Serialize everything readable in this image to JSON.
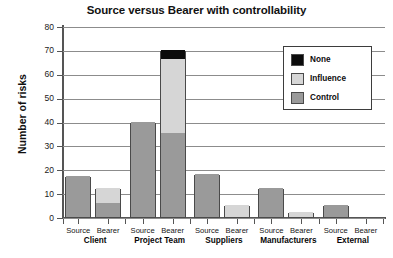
{
  "chart_data": {
    "type": "bar",
    "title": "Source versus Bearer with controllability",
    "xlabel": "",
    "ylabel": "Number of risks",
    "ylim": [
      0,
      80
    ],
    "ytick_step": 10,
    "yticks": [
      80,
      70,
      60,
      50,
      40,
      30,
      20,
      10,
      0
    ],
    "grid": true,
    "stacked": true,
    "legend_position": "inside-top-right",
    "categories": [
      "Client Source",
      "Client Bearer",
      "Project Team Source",
      "Project Team Bearer",
      "Suppliers Source",
      "Suppliers Bearer",
      "Manufacturers Source",
      "Manufacturers Bearer",
      "External Source",
      "External Bearer"
    ],
    "series": [
      {
        "name": "Control",
        "color": "#9a9a9a",
        "values": [
          17,
          6,
          40,
          35,
          18,
          0,
          12,
          0,
          5,
          0
        ]
      },
      {
        "name": "Influence",
        "color": "#d6d6d6",
        "values": [
          0,
          6,
          0,
          31,
          0,
          5,
          0,
          2,
          0,
          0
        ]
      },
      {
        "name": "None",
        "color": "#0b0b0b",
        "values": [
          0,
          0,
          0,
          4,
          0,
          0,
          0,
          0,
          0,
          0
        ]
      }
    ],
    "group_totals": [
      17,
      12,
      40,
      70,
      18,
      5,
      12,
      2,
      5,
      0
    ],
    "groups": [
      {
        "group": "Client",
        "bars": [
          {
            "role": "Source",
            "total": 17,
            "control": 17,
            "influence": 0,
            "none": 0
          },
          {
            "role": "Bearer",
            "total": 12,
            "control": 6,
            "influence": 6,
            "none": 0
          }
        ]
      },
      {
        "group": "Project Team",
        "bars": [
          {
            "role": "Source",
            "total": 40,
            "control": 40,
            "influence": 0,
            "none": 0
          },
          {
            "role": "Bearer",
            "total": 70,
            "control": 35,
            "influence": 31,
            "none": 4
          }
        ]
      },
      {
        "group": "Suppliers",
        "bars": [
          {
            "role": "Source",
            "total": 18,
            "control": 18,
            "influence": 0,
            "none": 0
          },
          {
            "role": "Bearer",
            "total": 5,
            "control": 0,
            "influence": 5,
            "none": 0
          }
        ]
      },
      {
        "group": "Manufacturers",
        "bars": [
          {
            "role": "Source",
            "total": 12,
            "control": 12,
            "influence": 0,
            "none": 0
          },
          {
            "role": "Bearer",
            "total": 2,
            "control": 0,
            "influence": 2,
            "none": 0
          }
        ]
      },
      {
        "group": "External",
        "bars": [
          {
            "role": "Source",
            "total": 5,
            "control": 5,
            "influence": 0,
            "none": 0
          },
          {
            "role": "Bearer",
            "total": 0,
            "control": 0,
            "influence": 0,
            "none": 0
          }
        ]
      }
    ]
  },
  "legend": {
    "items": [
      {
        "label": "None",
        "color": "#0b0b0b"
      },
      {
        "label": "Influence",
        "color": "#d6d6d6"
      },
      {
        "label": "Control",
        "color": "#9a9a9a"
      }
    ]
  },
  "axis": {
    "y_title": "Number of risks",
    "y_ticks": [
      "80",
      "70",
      "60",
      "50",
      "40",
      "30",
      "20",
      "10",
      "0"
    ],
    "role_labels": [
      "Source",
      "Bearer"
    ],
    "group_labels": [
      "Client",
      "Project Team",
      "Suppliers",
      "Manufacturers",
      "External"
    ]
  },
  "title": {
    "text": "Source versus Bearer with controllability"
  }
}
